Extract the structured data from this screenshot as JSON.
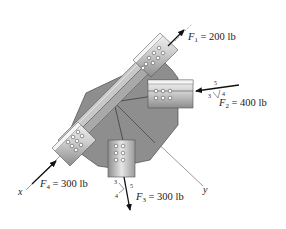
{
  "figure": {
    "type": "statics free-body diagram",
    "colors": {
      "plate": "#8e8e8e",
      "plate_edge": "#444444",
      "member_light": "#e4e4e4",
      "member_mid": "#bdbdbd",
      "member_dark": "#8a8a8a",
      "arrow": "#111111",
      "axis_line": "#555555"
    }
  },
  "forces": [
    {
      "id": "F1",
      "symbol": "F",
      "subscript": "1",
      "equals": "=",
      "value": "200 lb"
    },
    {
      "id": "F2",
      "symbol": "F",
      "subscript": "2",
      "equals": "=",
      "value": "400 lb",
      "slope": {
        "hyp": "5",
        "a": "3",
        "b": "4"
      }
    },
    {
      "id": "F3",
      "symbol": "F",
      "subscript": "3",
      "equals": "=",
      "value": "300 lb",
      "slope": {
        "hyp": "5",
        "a": "3",
        "b": "4"
      }
    },
    {
      "id": "F4",
      "symbol": "F",
      "subscript": "4",
      "equals": "=",
      "value": "300 lb"
    }
  ],
  "axes": {
    "x": "x",
    "y": "y"
  }
}
